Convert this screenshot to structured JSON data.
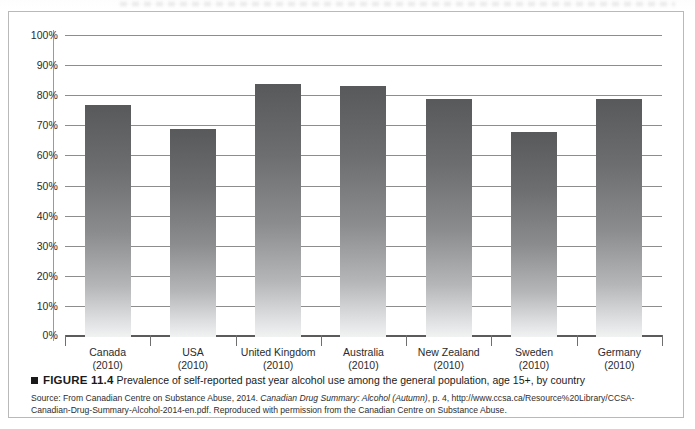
{
  "figure": {
    "number": "FIGURE 11.4",
    "caption": "Prevalence of self-reported past year alcohol use among the general population, age 15+, by country",
    "source_lines": [
      {
        "segments": [
          {
            "text": "Source: From Canadian Centre on Substance Abuse, 2014. ",
            "italic": false
          },
          {
            "text": "Canadian Drug Summary: Alcohol (Autumn)",
            "italic": true
          },
          {
            "text": ", p. 4, http://www.ccsa.ca/Resource%20Library/CCSA-",
            "italic": false
          }
        ]
      },
      {
        "segments": [
          {
            "text": "Canadian-Drug-Summary-Alcohol-2014-en.pdf. Reproduced with permission from the Canadian Centre on Substance Abuse.",
            "italic": false
          }
        ]
      }
    ]
  },
  "chart_data": {
    "type": "bar",
    "title": "Prevalence of self-reported past year alcohol use among the general population, age 15+, by country",
    "xlabel": "",
    "ylabel": "",
    "ylim": [
      0,
      100
    ],
    "yticks": [
      0,
      10,
      20,
      30,
      40,
      50,
      60,
      70,
      80,
      90,
      100
    ],
    "ytick_labels": [
      "0%",
      "10%",
      "20%",
      "30%",
      "40%",
      "50%",
      "60%",
      "70%",
      "80%",
      "90%",
      "100%"
    ],
    "grid": true,
    "legend": "none",
    "categories": [
      {
        "country": "Canada",
        "year": "(2010)"
      },
      {
        "country": "USA",
        "year": "(2010)"
      },
      {
        "country": "United Kingdom",
        "year": "(2010)"
      },
      {
        "country": "Australia",
        "year": "(2010)"
      },
      {
        "country": "New Zealand",
        "year": "(2010)"
      },
      {
        "country": "Sweden",
        "year": "(2010)"
      },
      {
        "country": "Germany",
        "year": "(2010)"
      }
    ],
    "values": [
      77,
      69,
      84,
      83.5,
      79,
      68,
      79
    ],
    "value_unit": "%",
    "bar_color_top": "#58595b",
    "bar_color_bottom": "#f1f2f2"
  }
}
